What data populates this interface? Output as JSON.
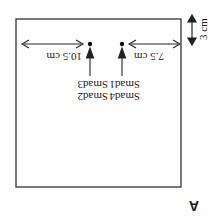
{
  "figure": {
    "panel_label": "A",
    "rotation_deg": 180,
    "box": {
      "description": "rectangular plate outline"
    },
    "dimensions": {
      "top_offset": "3 cm",
      "left_distance": "10.5 cm",
      "right_distance": "7.5 cm"
    },
    "spots": [
      {
        "label_top": "Smad2",
        "label_bottom": "Smad3",
        "distance": "10.5 cm"
      },
      {
        "label_top": "Smad4",
        "label_bottom": "Smad1",
        "distance": "7.5 cm"
      }
    ]
  }
}
